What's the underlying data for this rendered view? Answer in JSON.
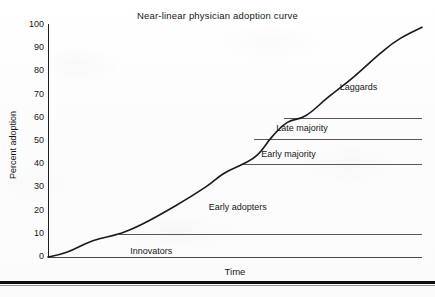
{
  "chart_data": {
    "type": "line",
    "title": "Near-linear physician adoption curve",
    "xlabel": "Time",
    "ylabel": "Percent adoption",
    "ylim": [
      0,
      100
    ],
    "xlim": [
      0,
      100
    ],
    "grid": false,
    "legend": "none",
    "ytick_labels": [
      "100",
      "90",
      "80",
      "70",
      "60",
      "50",
      "40",
      "30",
      "20",
      "10",
      "0"
    ],
    "ytick_values": [
      100,
      90,
      80,
      70,
      60,
      50,
      40,
      30,
      20,
      10,
      0
    ],
    "xtick_labels": [],
    "series": [
      {
        "name": "Adoption",
        "x": [
          0,
          5,
          12,
          19,
          25,
          34,
          42,
          47,
          52,
          56,
          60,
          64,
          69,
          75,
          82,
          89,
          94,
          100
        ],
        "values": [
          0,
          2,
          7,
          10,
          14,
          22,
          30,
          36,
          40,
          44,
          52,
          58,
          61,
          69,
          78,
          88,
          94,
          99
        ]
      }
    ],
    "reference_lines": [
      {
        "label": "Innovators",
        "level": 0,
        "x_start": 0,
        "x_end": 100
      },
      {
        "label": "Early adopters",
        "level": 10,
        "x_start": 19,
        "x_end": 100
      },
      {
        "label": "Early majority",
        "level": 40,
        "x_start": 52,
        "x_end": 100
      },
      {
        "label": "Late majority",
        "level": 51,
        "x_start": 55,
        "x_end": 100
      },
      {
        "label": "Laggards",
        "level": 60,
        "x_start": 63,
        "x_end": 100
      }
    ],
    "annotations": [
      {
        "text": "Innovators",
        "x": 22,
        "y": 2
      },
      {
        "text": "Early adopters",
        "x": 43,
        "y": 21
      },
      {
        "text": "Early majority",
        "x": 57,
        "y": 44
      },
      {
        "text": "Late majority",
        "x": 61,
        "y": 55
      },
      {
        "text": "Laggards",
        "x": 78,
        "y": 73
      }
    ],
    "colors": {
      "curve": "#1a1a1a",
      "axis": "#1d1d1d",
      "reference_line": "#585858",
      "text": "#171717",
      "background": "#fdfdfd",
      "bottom_rule": "#0d0d0d"
    }
  }
}
